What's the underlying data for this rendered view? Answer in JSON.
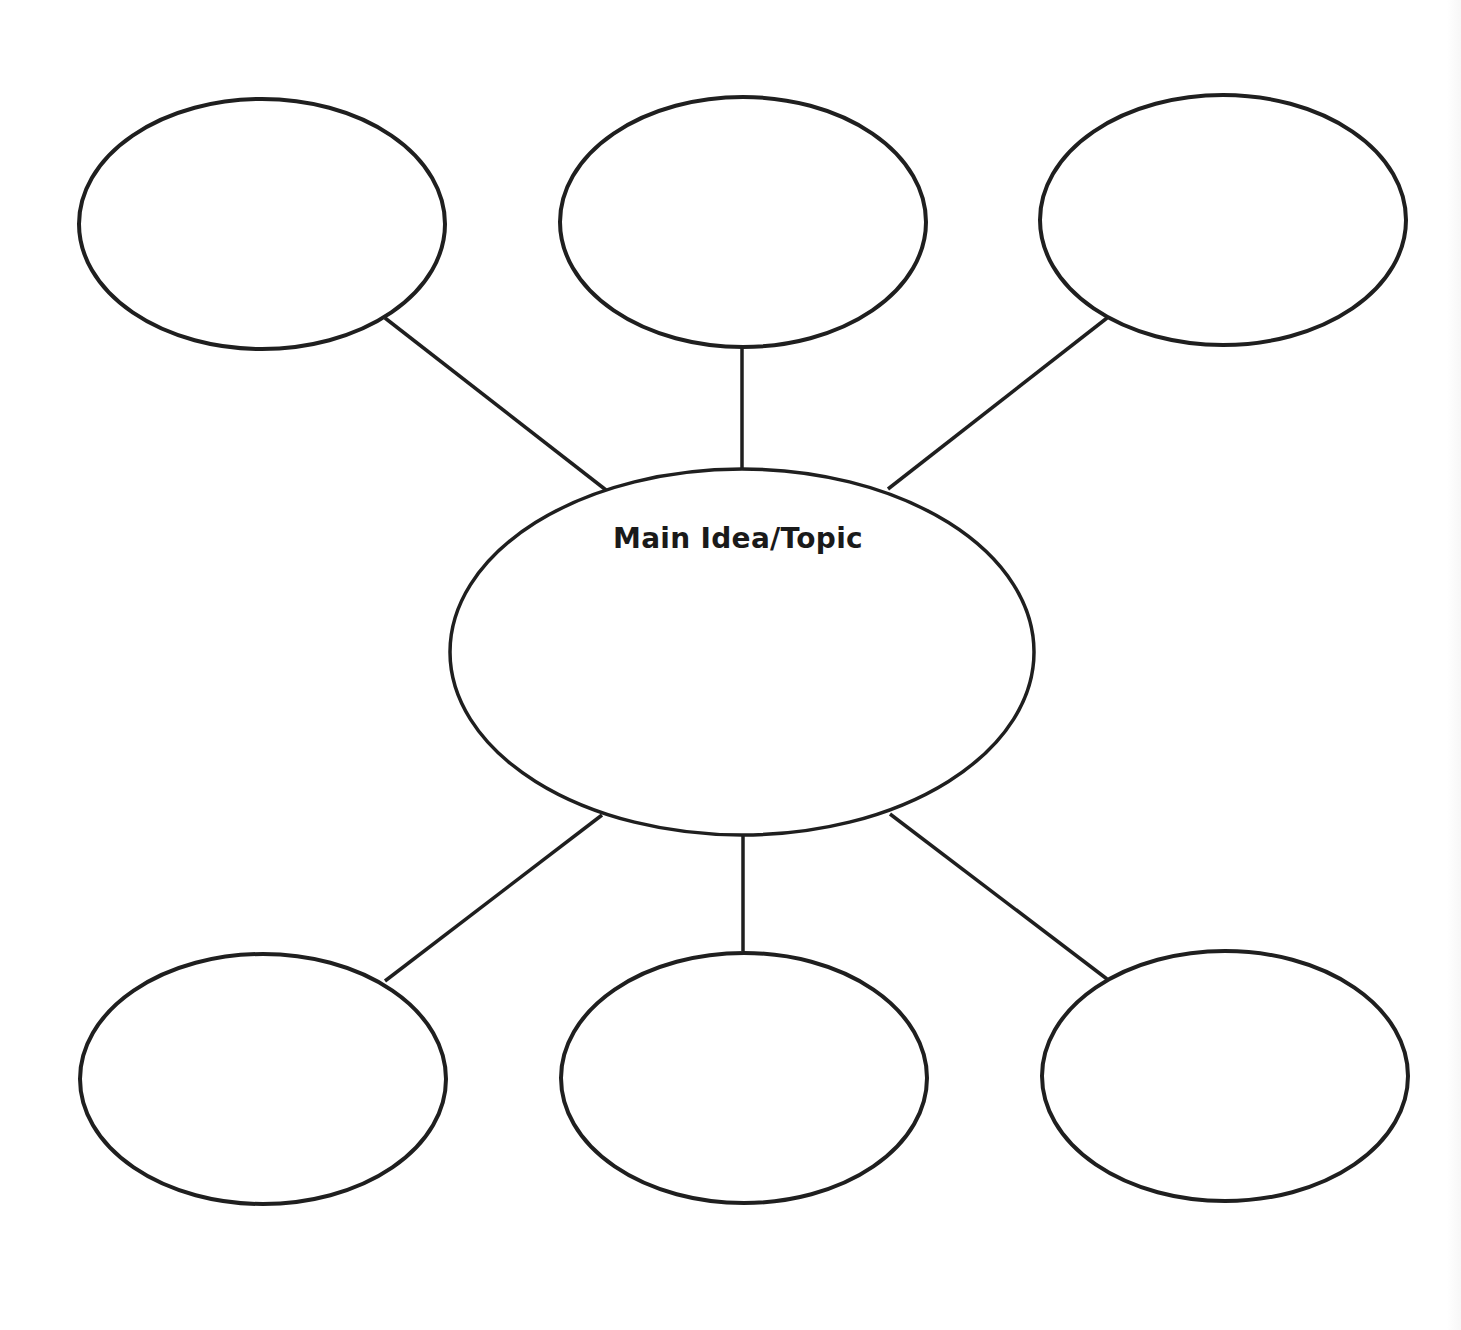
{
  "diagram": {
    "type": "bubble-map",
    "stroke_color": "#1f1f1f",
    "background_color": "#ffffff",
    "center_node": {
      "id": "main",
      "label": "Main Idea/Topic",
      "cx": 742,
      "cy": 652,
      "rx": 292,
      "ry": 183
    },
    "satellite_nodes": [
      {
        "id": "top-left",
        "label": "",
        "cx": 262,
        "cy": 224,
        "rx": 183,
        "ry": 125
      },
      {
        "id": "top-middle",
        "label": "",
        "cx": 743,
        "cy": 222,
        "rx": 183,
        "ry": 125
      },
      {
        "id": "top-right",
        "label": "",
        "cx": 1223,
        "cy": 220,
        "rx": 183,
        "ry": 125
      },
      {
        "id": "bottom-left",
        "label": "",
        "cx": 263,
        "cy": 1079,
        "rx": 183,
        "ry": 125
      },
      {
        "id": "bottom-middle",
        "label": "",
        "cx": 744,
        "cy": 1078,
        "rx": 183,
        "ry": 125
      },
      {
        "id": "bottom-right",
        "label": "",
        "cx": 1225,
        "cy": 1076,
        "rx": 183,
        "ry": 125
      }
    ],
    "connectors": [
      {
        "from": "top-left",
        "to": "main",
        "x1": 385,
        "y1": 318,
        "x2": 606,
        "y2": 490
      },
      {
        "from": "top-middle",
        "to": "main",
        "x1": 742,
        "y1": 348,
        "x2": 742,
        "y2": 469
      },
      {
        "from": "top-right",
        "to": "main",
        "x1": 1107,
        "y1": 318,
        "x2": 888,
        "y2": 489
      },
      {
        "from": "main",
        "to": "bottom-left",
        "x1": 602,
        "y1": 815,
        "x2": 385,
        "y2": 981
      },
      {
        "from": "main",
        "to": "bottom-middle",
        "x1": 743,
        "y1": 836,
        "x2": 743,
        "y2": 951
      },
      {
        "from": "main",
        "to": "bottom-right",
        "x1": 890,
        "y1": 814,
        "x2": 1107,
        "y2": 979
      }
    ]
  }
}
